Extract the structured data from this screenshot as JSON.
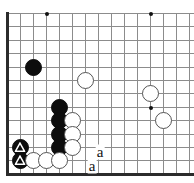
{
  "diagram": {
    "board_style": "go-goban-partial",
    "colors": {
      "background": "#ffffff",
      "gridline": "#8c8c8c",
      "board_edge": "#2b2b2b",
      "black_stone": "#0d0d0d",
      "white_stone": "#ffffff",
      "white_stone_outline": "#555555",
      "star_point": "#111111",
      "label_text": "#111111"
    },
    "geometry": {
      "origin_x": 7,
      "origin_y": 13,
      "step_x": 13,
      "step_y": 13.4,
      "cols": 15,
      "rows": 13,
      "stone_size": 17
    },
    "edges": {
      "left_edge": true,
      "bottom_edge": true,
      "top_edge": false,
      "right_edge": false
    },
    "star_points": [
      {
        "col": 4,
        "row": 1,
        "name": "star-point-upper-left"
      },
      {
        "col": 12,
        "row": 1,
        "name": "star-point-upper-right"
      },
      {
        "col": 12,
        "row": 8,
        "name": "star-point-right"
      }
    ],
    "stones": [
      {
        "color": "black",
        "col": 3,
        "row": 5,
        "mark": "",
        "name": "black-stone-c5"
      },
      {
        "color": "black",
        "col": 5,
        "row": 8,
        "mark": "",
        "name": "black-stone-e8"
      },
      {
        "color": "black",
        "col": 5,
        "row": 9,
        "mark": "",
        "name": "black-stone-e9"
      },
      {
        "color": "black",
        "col": 5,
        "row": 10,
        "mark": "",
        "name": "black-stone-e10"
      },
      {
        "color": "black",
        "col": 5,
        "row": 11,
        "mark": "",
        "name": "black-stone-e11"
      },
      {
        "color": "black",
        "col": 2,
        "row": 11,
        "mark": "triangle",
        "name": "black-stone-marked-b11"
      },
      {
        "color": "black",
        "col": 2,
        "row": 12,
        "mark": "triangle",
        "name": "black-stone-marked-b12"
      },
      {
        "color": "white",
        "col": 7,
        "row": 6,
        "mark": "",
        "name": "white-stone-g6"
      },
      {
        "color": "white",
        "col": 6,
        "row": 9,
        "mark": "",
        "name": "white-stone-f9"
      },
      {
        "color": "white",
        "col": 6,
        "row": 10,
        "mark": "",
        "name": "white-stone-f10"
      },
      {
        "color": "white",
        "col": 6,
        "row": 11,
        "mark": "",
        "name": "white-stone-f11"
      },
      {
        "color": "white",
        "col": 3,
        "row": 12,
        "mark": "",
        "name": "white-stone-c12"
      },
      {
        "color": "white",
        "col": 4,
        "row": 12,
        "mark": "",
        "name": "white-stone-d12"
      },
      {
        "color": "white",
        "col": 5,
        "row": 12,
        "mark": "",
        "name": "white-stone-e12"
      },
      {
        "color": "white",
        "col": 12,
        "row": 7,
        "mark": "",
        "name": "white-stone-l7"
      },
      {
        "color": "white",
        "col": 13,
        "row": 9,
        "mark": "",
        "name": "white-stone-m9"
      }
    ],
    "labels": [
      {
        "text": "a",
        "x": 100,
        "y": 152,
        "name": "point-label-a-upper"
      },
      {
        "text": "a",
        "x": 92,
        "y": 166,
        "name": "point-label-a-lower"
      }
    ]
  }
}
